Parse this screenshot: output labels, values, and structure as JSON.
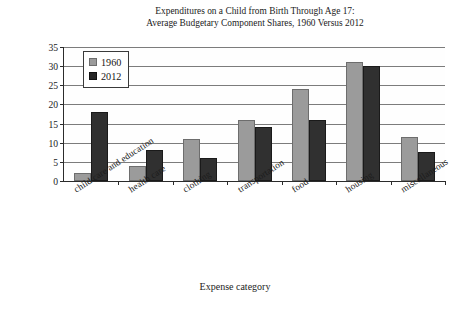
{
  "chart_data": {
    "type": "bar",
    "title": "Expenditures on a Child from Birth Through Age 17: Average Budgetary Component Shares, 1960 Versus 2012",
    "title_line1": "Expenditures on a Child from Birth Through Age 17:",
    "title_line2": "Average Budgetary Component Shares, 1960 Versus 2012",
    "xlabel": "Expense category",
    "ylabel": "Average percentage of total budget",
    "categories": [
      "child care and education",
      "health care",
      "clothing",
      "transportation",
      "food",
      "housing",
      "miscellaneous"
    ],
    "series": [
      {
        "name": "1960",
        "color": "#9b9b9b",
        "values": [
          2,
          4,
          11,
          16,
          24,
          31,
          11.5
        ]
      },
      {
        "name": "2012",
        "color": "#303030",
        "values": [
          18,
          8,
          6,
          14,
          16,
          30,
          7.5
        ]
      }
    ],
    "ylim": [
      0,
      35
    ],
    "ytick_step": 5,
    "yticks": [
      0,
      5,
      10,
      15,
      20,
      25,
      30,
      35
    ],
    "ytick_labels": [
      "0",
      "5",
      "10",
      "15",
      "20",
      "25",
      "30",
      "35"
    ],
    "grid": true,
    "grid_axis": "y",
    "legend_position": "upper left inside plot"
  }
}
